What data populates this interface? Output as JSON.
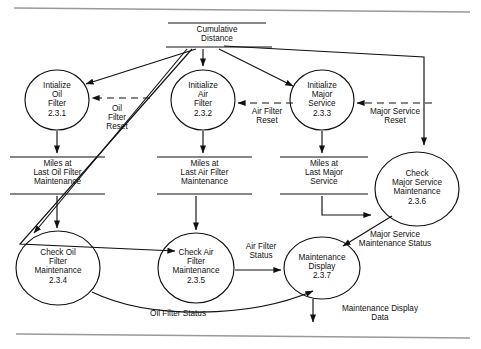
{
  "diagram": {
    "type": "data-flow-diagram",
    "title": "",
    "processes": [
      {
        "id": "2.3.1",
        "name": "Intialize Oil Filter",
        "label": "Intialize\nOil\nFilter\n2.3.1",
        "cx": 57,
        "cy": 100,
        "rx": 32,
        "ry": 30
      },
      {
        "id": "2.3.2",
        "name": "Initialize Air Filter",
        "label": "Initialize\nAir\nFilter\n2.3.2",
        "cx": 203,
        "cy": 100,
        "rx": 32,
        "ry": 30
      },
      {
        "id": "2.3.3",
        "name": "Initialize Major Service",
        "label": "Initialize\nMajor\nService\n2.3.3",
        "cx": 322,
        "cy": 100,
        "rx": 32,
        "ry": 30
      },
      {
        "id": "2.3.6",
        "name": "Check Major Service Maintenance",
        "label": "Check\nMajor Service\nMaintenance\n2.3.6",
        "cx": 417,
        "cy": 189,
        "rx": 42,
        "ry": 37
      },
      {
        "id": "2.3.4",
        "name": "Check Oil Filter Maintenance",
        "label": "Check Oil\nFilter\nMaintenance\n2.3.4",
        "cx": 58,
        "cy": 268,
        "rx": 42,
        "ry": 37
      },
      {
        "id": "2.3.5",
        "name": "Check Air Filter Maintenance",
        "label": "Check Air\nFilter\nMaintenance\n2.3.5",
        "cx": 196,
        "cy": 268,
        "rx": 38,
        "ry": 35
      },
      {
        "id": "2.3.7",
        "name": "Maintenance Display",
        "label": "Maintenance\nDisplay\n2.3.7",
        "cx": 322,
        "cy": 268,
        "rx": 38,
        "ry": 31
      }
    ],
    "data_stores": [
      {
        "id": "cumulative-distance",
        "label": "Cumulative\nDistance",
        "x": 168,
        "y": 23,
        "w": 98
      },
      {
        "id": "miles-last-oil-filter",
        "label": "Miles at\nLast Oil Filter\nMaintenance",
        "x": 10,
        "y": 157,
        "w": 95
      },
      {
        "id": "miles-last-air-filter",
        "label": "Miles at\nLast Air Filter\nMaintenance",
        "x": 157,
        "y": 157,
        "w": 95
      },
      {
        "id": "miles-last-major-service",
        "label": "Miles at\nLast Major\nService",
        "x": 280,
        "y": 157,
        "w": 88
      }
    ],
    "flow_labels": [
      {
        "id": "oil-filter-reset",
        "text": "Oil\nFilter\nReset",
        "x": 95,
        "y": 104
      },
      {
        "id": "air-filter-reset",
        "text": "Air Filter\nReset",
        "x": 241,
        "y": 107
      },
      {
        "id": "major-service-reset",
        "text": "Major Service\nReset",
        "x": 360,
        "y": 107
      },
      {
        "id": "air-filter-status",
        "text": "Air Filter\nStatus",
        "x": 240,
        "y": 243
      },
      {
        "id": "major-service-maintenance-status",
        "text": "Major Service\nMaintenance Status",
        "x": 340,
        "y": 231
      },
      {
        "id": "oil-filter-status",
        "text": "Oil Filter Status",
        "x": 133,
        "y": 311
      },
      {
        "id": "maintenance-display-data",
        "text": "Maintenance Display\nData",
        "x": 330,
        "y": 306
      }
    ]
  }
}
